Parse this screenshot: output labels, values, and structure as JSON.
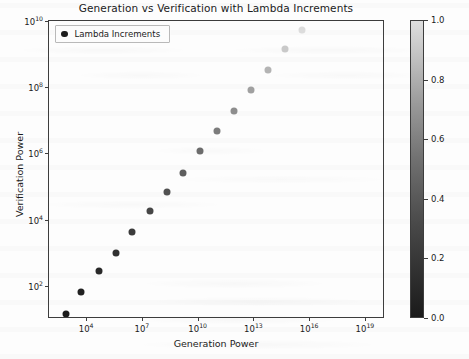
{
  "chart_data": {
    "type": "scatter",
    "title": "Generation vs Verification with Lambda Increments",
    "xlabel": "Generation Power",
    "ylabel": "Verification Power",
    "xscale": "log",
    "yscale": "log",
    "xlim": [
      100.0,
      1.2e+20
    ],
    "ylim": [
      10.0,
      10000000000.0
    ],
    "grid": false,
    "legend": {
      "position": "upper left",
      "entries": [
        "Lambda Increments"
      ]
    },
    "colorbar": {
      "label": "Lambda Increments",
      "cmap": "gray",
      "vmin": 0.0,
      "vmax": 1.0,
      "ticks": [
        "1.0",
        "0.8",
        "0.6",
        "0.4",
        "0.2",
        "0.0"
      ],
      "tick_values": [
        1.0,
        0.8,
        0.6,
        0.4,
        0.2,
        0.0
      ]
    },
    "xticks": [
      10000,
      10000000.0,
      10000000000.0,
      10000000000000.0,
      1e+16,
      1e+19
    ],
    "xtick_labels": [
      {
        "base": "10",
        "exp": "4"
      },
      {
        "base": "10",
        "exp": "7"
      },
      {
        "base": "10",
        "exp": "10"
      },
      {
        "base": "10",
        "exp": "13"
      },
      {
        "base": "10",
        "exp": "16"
      },
      {
        "base": "10",
        "exp": "19"
      }
    ],
    "yticks": [
      100,
      10000,
      1000000,
      100000000,
      10000000000
    ],
    "ytick_labels": [
      {
        "base": "10",
        "exp": "2"
      },
      {
        "base": "10",
        "exp": "4"
      },
      {
        "base": "10",
        "exp": "6"
      },
      {
        "base": "10",
        "exp": "8"
      },
      {
        "base": "10",
        "exp": "10"
      }
    ],
    "series_name": "Lambda Increments",
    "points": [
      {
        "x": 800.0,
        "y": 14.0,
        "c": 0.0,
        "color": "#1c1c1c"
      },
      {
        "x": 5200.0,
        "y": 65.0,
        "c": 0.07,
        "color": "#222222"
      },
      {
        "x": 50000.0,
        "y": 280.0,
        "c": 0.14,
        "color": "#292929"
      },
      {
        "x": 400000.0,
        "y": 1000.0,
        "c": 0.21,
        "color": "#313131"
      },
      {
        "x": 3000000.0,
        "y": 4200.0,
        "c": 0.29,
        "color": "#3b3b3b"
      },
      {
        "x": 26000000.0,
        "y": 18000.0,
        "c": 0.36,
        "color": "#464646"
      },
      {
        "x": 220000000.0,
        "y": 68000.0,
        "c": 0.43,
        "color": "#515151"
      },
      {
        "x": 1600000000.0,
        "y": 260000.0,
        "c": 0.5,
        "color": "#5e5e5e"
      },
      {
        "x": 13000000000.0,
        "y": 1200000.0,
        "c": 0.57,
        "color": "#6c6c6c"
      },
      {
        "x": 110000000000.0,
        "y": 4700000.0,
        "c": 0.64,
        "color": "#7c7c7c"
      },
      {
        "x": 900000000000.0,
        "y": 19000000.0,
        "c": 0.71,
        "color": "#8d8d8d"
      },
      {
        "x": 7500000000000.0,
        "y": 85000000.0,
        "c": 0.79,
        "color": "#a0a0a0"
      },
      {
        "x": 60000000000000.0,
        "y": 340000000.0,
        "c": 0.86,
        "color": "#b4b4b4"
      },
      {
        "x": 500000000000000.0,
        "y": 1400000000.0,
        "c": 0.93,
        "color": "#c9c9c9"
      },
      {
        "x": 4200000000000000.0,
        "y": 5500000000.0,
        "c": 1.0,
        "color": "#dcdcdc"
      }
    ]
  },
  "axes": {
    "title": "Generation vs Verification with Lambda Increments",
    "x_label": "Generation Power",
    "y_label": "Verification Power"
  },
  "legend": {
    "label": "Lambda Increments"
  },
  "colorbar": {
    "label": "Lambda Increments"
  }
}
